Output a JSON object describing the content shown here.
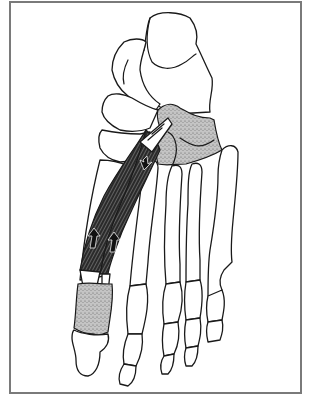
{
  "figure": {
    "elements": {
      "bones": [
        "talus",
        "navicular",
        "cuneiforms",
        "cuboid",
        "metatarsals",
        "phalanges"
      ],
      "highlighted_origin": "cuboid / lateral cuneiform (stippled)",
      "highlighted_insertion": "proximal phalanx of great toe (stippled)",
      "muscle": "two-bellied muscle with tendons",
      "arrows": [
        "down-arrow-near-origin",
        "up-arrow-medial-belly",
        "up-arrow-lateral-belly"
      ]
    },
    "colors": {
      "line": "#1a1a1a",
      "stipple": "#b8b8b8",
      "muscle": "#2a2a2a",
      "frame": "#7a7a7a",
      "background": "#ffffff"
    }
  }
}
